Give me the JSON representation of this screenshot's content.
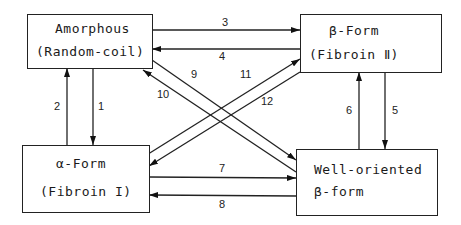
{
  "diagram": {
    "type": "state-transition",
    "nodes": [
      {
        "id": "amorphous",
        "line1": "Amorphous",
        "line2": "(Random-coil)"
      },
      {
        "id": "beta",
        "line1": "β-Form",
        "line2": "(Fibroin Ⅱ)"
      },
      {
        "id": "alpha",
        "line1": "α-Form",
        "line2": "(Fibroin I)"
      },
      {
        "id": "oriented",
        "line1": "Well-oriented",
        "line2": "β-form"
      }
    ],
    "edges": [
      {
        "label": "1",
        "from": "amorphous",
        "to": "alpha"
      },
      {
        "label": "2",
        "from": "alpha",
        "to": "amorphous"
      },
      {
        "label": "3",
        "from": "amorphous",
        "to": "beta"
      },
      {
        "label": "4",
        "from": "beta",
        "to": "amorphous"
      },
      {
        "label": "5",
        "from": "beta",
        "to": "oriented"
      },
      {
        "label": "6",
        "from": "oriented",
        "to": "beta"
      },
      {
        "label": "7",
        "from": "alpha",
        "to": "oriented"
      },
      {
        "label": "8",
        "from": "oriented",
        "to": "alpha"
      },
      {
        "label": "9",
        "from": "amorphous",
        "to": "oriented"
      },
      {
        "label": "10",
        "from": "oriented",
        "to": "amorphous"
      },
      {
        "label": "11",
        "from": "alpha",
        "to": "beta"
      },
      {
        "label": "12",
        "from": "beta",
        "to": "alpha"
      }
    ]
  }
}
